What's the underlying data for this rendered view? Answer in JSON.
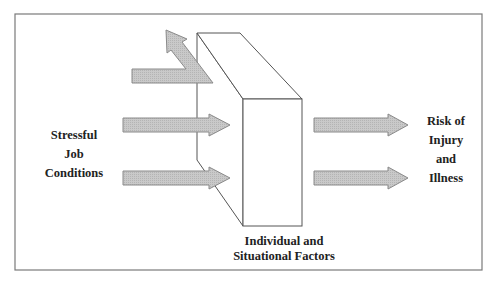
{
  "diagram": {
    "colors": {
      "frame": "#7a7a7a",
      "box_stroke": "#555555",
      "arrow_fill": "#c8c8c8",
      "arrow_stroke": "#8a8a8a",
      "text": "#222222"
    },
    "nodes": [
      {
        "id": "stressful-job-conditions",
        "lines": [
          "Stressful",
          "Job",
          "Conditions"
        ]
      },
      {
        "id": "individual-situational-factors",
        "lines": [
          "Individual and",
          "Situational Factors"
        ]
      },
      {
        "id": "risk-injury-illness",
        "lines": [
          "Risk of",
          "Injury",
          "and",
          "Illness"
        ]
      }
    ],
    "edges": [
      {
        "from": "stressful-job-conditions",
        "to": "individual-situational-factors",
        "type": "deflected",
        "note": "arrow deflected upward by buffer"
      },
      {
        "from": "stressful-job-conditions",
        "to": "individual-situational-factors",
        "type": "straight"
      },
      {
        "from": "stressful-job-conditions",
        "to": "individual-situational-factors",
        "type": "straight"
      },
      {
        "from": "individual-situational-factors",
        "to": "risk-injury-illness",
        "type": "straight"
      },
      {
        "from": "individual-situational-factors",
        "to": "risk-injury-illness",
        "type": "straight"
      }
    ]
  },
  "labels": {
    "left": [
      "Stressful",
      "Job",
      "Conditions"
    ],
    "bottom": [
      "Individual and",
      "Situational Factors"
    ],
    "right": [
      "Risk of",
      "Injury",
      "and",
      "Illness"
    ]
  }
}
